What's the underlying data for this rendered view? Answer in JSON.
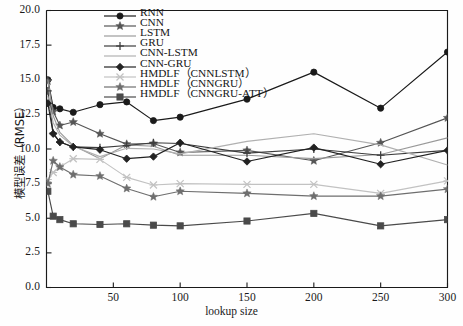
{
  "chart_data": {
    "type": "line",
    "title": "",
    "xlabel": "lookup size",
    "ylabel": "模型误差（RMSE）",
    "xlim": [
      0,
      300
    ],
    "ylim": [
      0,
      20
    ],
    "xticks": [
      50,
      100,
      150,
      200,
      250,
      300
    ],
    "xtick_labels": [
      "50",
      "100",
      "150",
      "200",
      "250",
      "300"
    ],
    "yticks": [
      0.0,
      2.5,
      5.0,
      7.5,
      10.0,
      12.5,
      15.0,
      17.5,
      20.0
    ],
    "ytick_labels": [
      "0.0",
      "2.5",
      "5.0",
      "7.5",
      "10.0",
      "12.5",
      "15.0",
      "17.5",
      "20.0"
    ],
    "grid": false,
    "legend_position": "upper-left-inside",
    "x": [
      1,
      5,
      10,
      20,
      40,
      60,
      80,
      100,
      150,
      200,
      250,
      300
    ],
    "series": [
      {
        "name": "RNN",
        "marker": "circle",
        "color": "#1a1a1a",
        "values": [
          15.0,
          13.0,
          12.9,
          12.65,
          13.2,
          13.4,
          12.05,
          12.3,
          13.6,
          15.55,
          12.95,
          17.0
        ]
      },
      {
        "name": "CNN",
        "marker": "star",
        "color": "#555555",
        "values": [
          14.9,
          12.7,
          11.7,
          11.95,
          11.1,
          10.35,
          10.4,
          9.75,
          9.9,
          9.15,
          10.45,
          12.25
        ]
      },
      {
        "name": "LSTM",
        "marker": "none",
        "color": "#9a9a9a",
        "values": [
          15.0,
          12.4,
          11.2,
          10.25,
          9.3,
          10.3,
          10.2,
          9.55,
          9.55,
          9.3,
          9.6,
          10.8
        ]
      },
      {
        "name": "GRU",
        "marker": "plus",
        "color": "#3c3c3c",
        "values": [
          14.2,
          11.15,
          10.5,
          10.15,
          10.1,
          10.25,
          10.45,
          10.4,
          9.7,
          10.0,
          9.55,
          9.9
        ]
      },
      {
        "name": "CNN-LSTM",
        "marker": "none",
        "color": "#b0b0b0",
        "values": [
          13.8,
          11.9,
          11.0,
          10.2,
          9.45,
          10.05,
          10.0,
          9.65,
          10.55,
          11.1,
          10.3,
          8.85
        ]
      },
      {
        "name": "CNN-GRU",
        "marker": "diamond",
        "color": "#222222",
        "values": [
          13.3,
          11.1,
          10.5,
          10.15,
          9.95,
          9.3,
          9.45,
          10.45,
          9.1,
          10.1,
          8.9,
          9.9
        ]
      },
      {
        "name": "HMDLF（CNNLSTM）",
        "marker": "x",
        "color": "#c2c2c2",
        "values": [
          7.8,
          8.3,
          8.7,
          9.3,
          9.25,
          7.95,
          7.4,
          7.5,
          7.45,
          7.45,
          6.8,
          7.7
        ]
      },
      {
        "name": "HMDLF（CNNGRU）",
        "marker": "star",
        "color": "#6e6e6e",
        "values": [
          7.5,
          9.15,
          8.7,
          8.15,
          8.05,
          7.15,
          6.55,
          6.95,
          6.8,
          6.6,
          6.6,
          7.1
        ]
      },
      {
        "name": "HMDLF（CNNGRU-ATT）",
        "marker": "square",
        "color": "#4a4a4a",
        "values": [
          6.95,
          5.15,
          4.9,
          4.6,
          4.55,
          4.6,
          4.5,
          4.45,
          4.8,
          5.35,
          4.45,
          4.9
        ]
      }
    ]
  }
}
